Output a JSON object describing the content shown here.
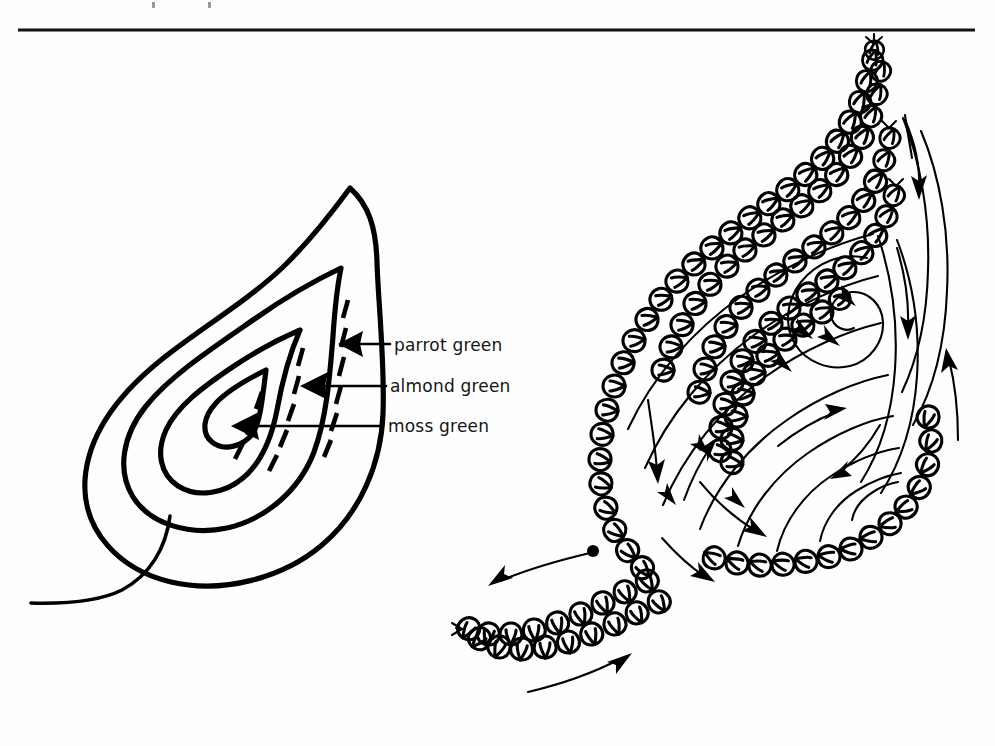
{
  "page": {
    "background_color": "#fefefe",
    "ink_color": "#000000",
    "rule_color": "#111111",
    "width": 995,
    "height": 746
  },
  "header": {
    "rule_present": true,
    "rule_y": 30,
    "rule_x_start": 18,
    "rule_x_end": 975
  },
  "figure": {
    "caption": "",
    "left_diagram": {
      "name": "paisley-colour-key",
      "description": "Outline paisley (boteh) motif with three concentric bands, each labelled with its thread colour."
    },
    "right_diagram": {
      "name": "paisley-stitch-direction",
      "description": "Same paisley worked in chain stitch, with arrows showing the direction of working and a dot marking the starting point."
    }
  },
  "labels": [
    {
      "id": "parrot-green",
      "text": "parrot green",
      "text_x": 394,
      "text_y": 351,
      "arrow_tip_x": 338,
      "arrow_tail_x": 390,
      "arrow_y": 344
    },
    {
      "id": "almond-green",
      "text": "almond green",
      "text_x": 390,
      "text_y": 392,
      "arrow_tip_x": 300,
      "arrow_tail_x": 386,
      "arrow_y": 386
    },
    {
      "id": "moss-green",
      "text": "moss green",
      "text_x": 388,
      "text_y": 432,
      "arrow_tip_x": 231,
      "arrow_tail_x": 382,
      "arrow_y": 426
    }
  ],
  "colors": {
    "ink": "#000000",
    "text": "#141414",
    "paper": "#fefefe"
  }
}
